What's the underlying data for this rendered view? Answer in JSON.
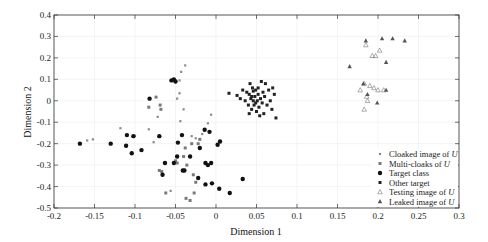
{
  "chart_data": {
    "type": "scatter",
    "title": "",
    "xlabel": "Dimension 1",
    "ylabel": "Dimension 2",
    "xlim": [
      -0.2,
      0.3
    ],
    "ylim": [
      -0.5,
      0.4
    ],
    "xticks": [
      -0.2,
      -0.15,
      -0.1,
      -0.05,
      0,
      0.05,
      0.1,
      0.15,
      0.2,
      0.25,
      0.3
    ],
    "xtick_labels": [
      "-0.2",
      "-0.15",
      "-0.1",
      "-0.05",
      "0",
      "0.05",
      "0.1",
      "0.15",
      "0.2",
      "0.25",
      "0.3"
    ],
    "yticks": [
      0.4,
      0.3,
      0.2,
      0.1,
      0,
      -0.1,
      -0.2,
      -0.3,
      -0.4,
      -0.5
    ],
    "ytick_labels": [
      "0.4",
      "0.3",
      "0.2",
      "0.1",
      "0",
      "-0.1",
      "-0.2",
      "-0.3",
      "-0.4",
      "-0.5"
    ],
    "grid": true,
    "legend_position": "lower right",
    "series": [
      {
        "name": "Cloaked image of U",
        "marker": "small-dot",
        "color": "#8a8a8a",
        "points": [
          [
            -0.159,
            -0.185
          ],
          [
            -0.152,
            -0.18
          ],
          [
            -0.118,
            -0.128
          ],
          [
            -0.1,
            -0.163
          ],
          [
            -0.083,
            -0.133
          ],
          [
            -0.077,
            -0.193
          ],
          [
            -0.072,
            -0.075
          ],
          [
            -0.056,
            -0.42
          ],
          [
            -0.044,
            -0.095
          ],
          [
            -0.03,
            -0.165
          ],
          [
            -0.025,
            -0.175
          ],
          [
            -0.017,
            -0.155
          ],
          [
            -0.01,
            -0.105
          ],
          [
            -0.006,
            -0.065
          ],
          [
            -0.04,
            -0.04
          ],
          [
            -0.038,
            0.165
          ],
          [
            -0.043,
            0.135
          ],
          [
            -0.045,
            0.095
          ],
          [
            -0.048,
            0.01
          ],
          [
            -0.045,
            0.035
          ]
        ]
      },
      {
        "name": "Multi-cloaks of U",
        "marker": "square",
        "color": "#7a7a7a",
        "points": [
          [
            -0.083,
            -0.03
          ],
          [
            -0.074,
            0.017
          ],
          [
            -0.069,
            -0.02
          ],
          [
            -0.068,
            -0.04
          ],
          [
            -0.07,
            -0.325
          ],
          [
            -0.067,
            -0.33
          ],
          [
            -0.062,
            -0.43
          ],
          [
            -0.05,
            -0.28
          ],
          [
            -0.048,
            -0.29
          ],
          [
            -0.04,
            -0.26
          ],
          [
            -0.038,
            -0.22
          ],
          [
            -0.036,
            -0.3
          ],
          [
            -0.03,
            -0.2
          ],
          [
            -0.028,
            -0.345
          ],
          [
            -0.027,
            -0.43
          ],
          [
            -0.025,
            -0.38
          ],
          [
            -0.022,
            -0.2
          ],
          [
            -0.02,
            -0.18
          ],
          [
            -0.037,
            -0.455
          ],
          [
            -0.032,
            -0.465
          ]
        ]
      },
      {
        "name": "Target class",
        "marker": "filled-circle",
        "color": "#111111",
        "points": [
          [
            -0.168,
            -0.2
          ],
          [
            -0.13,
            -0.2
          ],
          [
            -0.11,
            -0.16
          ],
          [
            -0.111,
            -0.21
          ],
          [
            -0.104,
            -0.245
          ],
          [
            -0.102,
            -0.165
          ],
          [
            -0.092,
            -0.23
          ],
          [
            -0.082,
            0.01
          ],
          [
            -0.07,
            -0.165
          ],
          [
            -0.066,
            -0.345
          ],
          [
            -0.063,
            -0.29
          ],
          [
            -0.052,
            -0.29
          ],
          [
            -0.048,
            -0.26
          ],
          [
            -0.047,
            -0.195
          ],
          [
            -0.042,
            -0.16
          ],
          [
            -0.041,
            -0.325
          ],
          [
            -0.039,
            -0.325
          ],
          [
            -0.032,
            -0.26
          ],
          [
            -0.022,
            -0.36
          ],
          [
            -0.02,
            -0.22
          ],
          [
            -0.014,
            -0.135
          ],
          [
            -0.013,
            -0.29
          ],
          [
            -0.013,
            -0.39
          ],
          [
            -0.01,
            -0.3
          ],
          [
            -0.008,
            -0.145
          ],
          [
            -0.006,
            -0.29
          ],
          [
            -0.005,
            -0.385
          ],
          [
            0.002,
            -0.205
          ],
          [
            0.005,
            -0.19
          ],
          [
            0.004,
            -0.41
          ],
          [
            0.017,
            -0.43
          ],
          [
            0.033,
            -0.365
          ],
          [
            -0.055,
            0.095
          ],
          [
            -0.052,
            0.1
          ],
          [
            -0.05,
            0.09
          ]
        ]
      },
      {
        "name": "Other target",
        "marker": "square",
        "color": "#222222",
        "points": [
          [
            0.016,
            0.035
          ],
          [
            0.026,
            0.025
          ],
          [
            0.03,
            0.01
          ],
          [
            0.033,
            0.05
          ],
          [
            0.036,
            0.0
          ],
          [
            0.038,
            0.04
          ],
          [
            0.04,
            -0.02
          ],
          [
            0.041,
            0.03
          ],
          [
            0.042,
            0.08
          ],
          [
            0.043,
            0.01
          ],
          [
            0.044,
            -0.04
          ],
          [
            0.045,
            0.06
          ],
          [
            0.046,
            0.0
          ],
          [
            0.047,
            -0.02
          ],
          [
            0.048,
            0.02
          ],
          [
            0.049,
            0.05
          ],
          [
            0.05,
            -0.05
          ],
          [
            0.051,
            0.0
          ],
          [
            0.052,
            0.03
          ],
          [
            0.053,
            -0.03
          ],
          [
            0.055,
            0.01
          ],
          [
            0.056,
            0.09
          ],
          [
            0.057,
            -0.01
          ],
          [
            0.058,
            0.04
          ],
          [
            0.059,
            -0.06
          ],
          [
            0.06,
            0.02
          ],
          [
            0.061,
            0.08
          ],
          [
            0.063,
            -0.02
          ],
          [
            0.065,
            0.05
          ],
          [
            0.067,
            0.0
          ],
          [
            0.069,
            -0.04
          ],
          [
            0.07,
            0.06
          ],
          [
            0.072,
            0.03
          ],
          [
            0.074,
            -0.08
          ],
          [
            0.041,
            -0.06
          ],
          [
            0.046,
            0.045
          ],
          [
            0.054,
            -0.07
          ],
          [
            0.049,
            -0.01
          ],
          [
            0.052,
            0.06
          ],
          [
            0.044,
            0.02
          ]
        ]
      },
      {
        "name": "Testing image of U",
        "marker": "hollow-triangle",
        "color": "#777777",
        "points": [
          [
            0.185,
            0.26
          ],
          [
            0.193,
            0.21
          ],
          [
            0.197,
            0.21
          ],
          [
            0.202,
            0.235
          ],
          [
            0.178,
            0.05
          ],
          [
            0.183,
            0.08
          ],
          [
            0.19,
            0.07
          ],
          [
            0.195,
            0.06
          ],
          [
            0.2,
            0.05
          ],
          [
            0.186,
            0.02
          ],
          [
            0.187,
            0.0
          ],
          [
            0.183,
            -0.04
          ],
          [
            0.207,
            0.05
          ]
        ]
      },
      {
        "name": "Leaked image of U",
        "marker": "filled-triangle",
        "color": "#555555",
        "points": [
          [
            0.185,
            0.28
          ],
          [
            0.205,
            0.29
          ],
          [
            0.218,
            0.29
          ],
          [
            0.233,
            0.28
          ],
          [
            0.21,
            0.18
          ],
          [
            0.165,
            0.16
          ],
          [
            0.182,
            0.08
          ],
          [
            0.187,
            0.03
          ],
          [
            0.21,
            0.05
          ],
          [
            0.199,
            -0.01
          ]
        ]
      }
    ]
  },
  "legend": {
    "items": [
      {
        "text": "Cloaked image of ",
        "italic": "U"
      },
      {
        "text": "Multi-cloaks of ",
        "italic": "U"
      },
      {
        "text": "Target class",
        "italic": ""
      },
      {
        "text": "Other target",
        "italic": ""
      },
      {
        "text": "Testing image of ",
        "italic": "U"
      },
      {
        "text": "Leaked image of ",
        "italic": "U"
      }
    ]
  }
}
